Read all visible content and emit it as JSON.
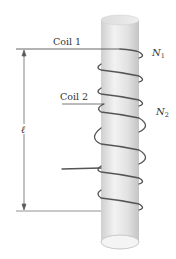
{
  "diagram": {
    "labels": {
      "coil1": "Coil 1",
      "coil2": "Coil 2",
      "n1": "N",
      "n1_sub": "1",
      "n2": "N",
      "n2_sub": "2",
      "length": "ℓ"
    },
    "colors": {
      "cylinder_light": "#ededed",
      "cylinder_mid": "#d8d8d8",
      "cylinder_edge": "#bdbdbd",
      "wire": "#555555",
      "lead": "#555555",
      "dimension": "#666666",
      "text": "#333333"
    }
  }
}
